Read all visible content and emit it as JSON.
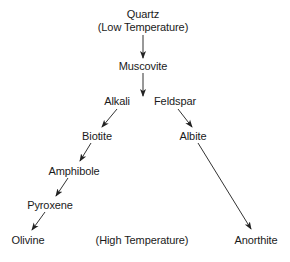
{
  "diagram": {
    "nodes": {
      "quartz": {
        "label": "Quartz",
        "x": 143,
        "y": 14
      },
      "low_temp": {
        "label": "(Low Temperature)",
        "x": 143,
        "y": 27
      },
      "muscovite": {
        "label": "Muscovite",
        "x": 143,
        "y": 66
      },
      "alkali": {
        "label": "Alkali",
        "x": 117,
        "y": 101
      },
      "feldspar": {
        "label": "Feldspar",
        "x": 175,
        "y": 101
      },
      "biotite": {
        "label": "Biotite",
        "x": 97,
        "y": 136
      },
      "albite": {
        "label": "Albite",
        "x": 193,
        "y": 136
      },
      "amphibole": {
        "label": "Amphibole",
        "x": 74,
        "y": 171
      },
      "pyroxene": {
        "label": "Pyroxene",
        "x": 50,
        "y": 205
      },
      "olivine": {
        "label": "Olivine",
        "x": 28,
        "y": 240
      },
      "high_temp": {
        "label": "(High Temperature)",
        "x": 142,
        "y": 240
      },
      "anorthite": {
        "label": "Anorthite",
        "x": 256,
        "y": 240
      }
    },
    "edges": [
      {
        "from": "quartz",
        "to": "muscovite",
        "x1": 143,
        "y1": 35,
        "x2": 143,
        "y2": 58
      },
      {
        "from": "muscovite",
        "to": "alkali-feldspar",
        "x1": 143,
        "y1": 73,
        "x2": 143,
        "y2": 96
      },
      {
        "from": "alkali",
        "to": "biotite",
        "x1": 117,
        "y1": 109,
        "x2": 102,
        "y2": 127
      },
      {
        "from": "feldspar",
        "to": "albite",
        "x1": 178,
        "y1": 109,
        "x2": 192,
        "y2": 127
      },
      {
        "from": "biotite",
        "to": "amphibole",
        "x1": 91,
        "y1": 143,
        "x2": 80,
        "y2": 161
      },
      {
        "from": "amphibole",
        "to": "pyroxene",
        "x1": 68,
        "y1": 178,
        "x2": 56,
        "y2": 196
      },
      {
        "from": "pyroxene",
        "to": "olivine",
        "x1": 45,
        "y1": 212,
        "x2": 32,
        "y2": 230
      },
      {
        "from": "albite",
        "to": "anorthite",
        "x1": 198,
        "y1": 143,
        "x2": 251,
        "y2": 229
      }
    ],
    "colors": {
      "text": "#1a1a1a",
      "line": "#333333",
      "background": "#ffffff"
    }
  }
}
